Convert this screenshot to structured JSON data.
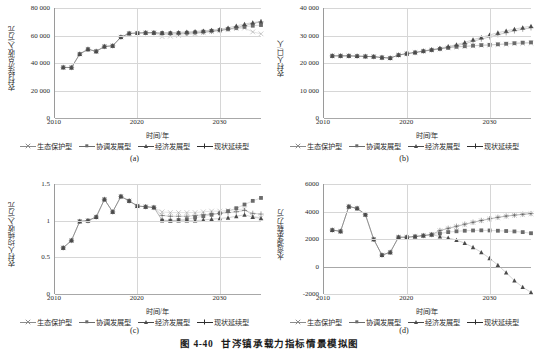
{
  "figure": {
    "number": "图 4-40",
    "title": "甘涔镇承载力指标情景模拟图"
  },
  "series_names": {
    "eco": "生态保护型",
    "coord": "协调发展型",
    "econ": "经济发展型",
    "status": "现状延续型"
  },
  "series_colors": {
    "eco": "#8c8c8c",
    "coord": "#6b6b6b",
    "econ": "#4a4a4a",
    "status": "#2e2e2e"
  },
  "common": {
    "xlabel": "时间/年",
    "xticks": [
      "2010",
      "2020",
      "2030"
    ],
    "xlim": [
      2010,
      2035
    ]
  },
  "chart_data": [
    {
      "id": "a",
      "panel_label": "(a)",
      "type": "line",
      "title": "",
      "xlabel": "时间/年",
      "ylabel": "农村经济总收入/万元",
      "xlim": [
        2010,
        2035
      ],
      "ylim": [
        0,
        80000
      ],
      "yticks": [
        0,
        20000,
        40000,
        60000,
        80000
      ],
      "ytick_labels": [
        "0",
        "20 000",
        "40 000",
        "60 000",
        "80 000"
      ],
      "xticks": [
        2010,
        2020,
        2030
      ],
      "grid": true,
      "legend_position": "bottom",
      "x": [
        2011,
        2012,
        2013,
        2014,
        2015,
        2016,
        2017,
        2018,
        2019,
        2020,
        2021,
        2022,
        2023,
        2024,
        2025,
        2026,
        2027,
        2028,
        2029,
        2030,
        2031,
        2032,
        2033,
        2034,
        2035
      ],
      "series": [
        {
          "name": "生态保护型",
          "key": "eco",
          "marker": "cross",
          "values": [
            36800,
            36700,
            46500,
            50000,
            48500,
            52000,
            52500,
            58800,
            61500,
            61800,
            62000,
            62000,
            59200,
            59500,
            60000,
            60600,
            61300,
            62000,
            62800,
            63500,
            64200,
            65000,
            65400,
            62600,
            61200
          ]
        },
        {
          "name": "协调发展型",
          "key": "coord",
          "marker": "square",
          "values": [
            36800,
            36700,
            46500,
            50000,
            48500,
            52000,
            52500,
            58800,
            61500,
            61800,
            62000,
            62000,
            61800,
            61700,
            61800,
            62000,
            62300,
            62800,
            63400,
            64000,
            64700,
            65500,
            66300,
            67100,
            67600
          ]
        },
        {
          "name": "经济发展型",
          "key": "econ",
          "marker": "triangle",
          "values": [
            36800,
            36700,
            46500,
            50000,
            48500,
            52000,
            52500,
            58800,
            61500,
            61800,
            62000,
            62000,
            62000,
            62100,
            62300,
            62600,
            63000,
            63400,
            63900,
            64500,
            65600,
            67000,
            68300,
            69400,
            70200
          ]
        },
        {
          "name": "现状延续型",
          "key": "status",
          "marker": "plus",
          "values": [
            36800,
            36700,
            46500,
            50000,
            48500,
            52000,
            52500,
            58800,
            61500,
            61800,
            62000,
            62000,
            61000,
            61000,
            61200,
            61500,
            61900,
            62400,
            63000,
            63700,
            64600,
            65800,
            67200,
            68700,
            69900
          ]
        }
      ]
    },
    {
      "id": "b",
      "panel_label": "(b)",
      "type": "line",
      "title": "",
      "xlabel": "时间/年",
      "ylabel": "农村人口/人",
      "xlim": [
        2010,
        2035
      ],
      "ylim": [
        0,
        40000
      ],
      "yticks": [
        0,
        10000,
        20000,
        30000,
        40000
      ],
      "ytick_labels": [
        "0",
        "10 000",
        "20 000",
        "30 000",
        "40 000"
      ],
      "xticks": [
        2010,
        2020,
        2030
      ],
      "grid": true,
      "legend_position": "bottom",
      "x": [
        2011,
        2012,
        2013,
        2014,
        2015,
        2016,
        2017,
        2018,
        2019,
        2020,
        2021,
        2022,
        2023,
        2024,
        2025,
        2026,
        2027,
        2028,
        2029,
        2030,
        2031,
        2032,
        2033,
        2034,
        2035
      ],
      "series": [
        {
          "name": "生态保护型",
          "key": "eco",
          "marker": "cross",
          "values": [
            22600,
            22600,
            22600,
            22500,
            22400,
            22300,
            22000,
            21800,
            22900,
            23400,
            23800,
            24300,
            24700,
            25100,
            25500,
            25800,
            26000,
            26200,
            26400,
            26500,
            26700,
            26800,
            27000,
            27100,
            27200
          ]
        },
        {
          "name": "协调发展型",
          "key": "coord",
          "marker": "square",
          "values": [
            22600,
            22600,
            22600,
            22500,
            22400,
            22300,
            22000,
            21800,
            22900,
            23400,
            23800,
            24300,
            24700,
            25100,
            25500,
            25900,
            26100,
            26300,
            26500,
            26600,
            26800,
            27000,
            27200,
            27400,
            27500
          ]
        },
        {
          "name": "经济发展型",
          "key": "econ",
          "marker": "triangle",
          "values": [
            22600,
            22600,
            22600,
            22500,
            22400,
            22300,
            22000,
            21800,
            22900,
            23400,
            23900,
            24400,
            24900,
            25400,
            26000,
            26700,
            27500,
            28500,
            29300,
            30200,
            31000,
            31700,
            32300,
            32900,
            33400
          ]
        },
        {
          "name": "现状延续型",
          "key": "status",
          "marker": "plus",
          "values": [
            22600,
            22600,
            22600,
            22500,
            22400,
            22300,
            22000,
            21800,
            22900,
            23400,
            23800,
            24300,
            24800,
            25200,
            25700,
            26300,
            27000,
            27900,
            28700,
            29500,
            30300,
            31000,
            31700,
            32300,
            32800
          ]
        }
      ]
    },
    {
      "id": "c",
      "panel_label": "(c)",
      "type": "line",
      "title": "",
      "xlabel": "时间/年",
      "ylabel": "农村人均纯收入/万元",
      "xlim": [
        2010,
        2035
      ],
      "ylim": [
        0,
        1.5
      ],
      "yticks": [
        0,
        0.5,
        1,
        1.5
      ],
      "ytick_labels": [
        "0",
        "0.5",
        "1",
        "1.5"
      ],
      "xticks": [
        2010,
        2020,
        2030
      ],
      "grid": true,
      "legend_position": "bottom",
      "x": [
        2011,
        2012,
        2013,
        2014,
        2015,
        2016,
        2017,
        2018,
        2019,
        2020,
        2021,
        2022,
        2023,
        2024,
        2025,
        2026,
        2027,
        2028,
        2029,
        2030,
        2031,
        2032,
        2033,
        2034,
        2035
      ],
      "series": [
        {
          "name": "生态保护型",
          "key": "eco",
          "marker": "cross",
          "values": [
            0.63,
            0.73,
            0.99,
            1.0,
            1.05,
            1.29,
            1.12,
            1.33,
            1.27,
            1.2,
            1.19,
            1.18,
            1.12,
            1.11,
            1.11,
            1.11,
            1.11,
            1.12,
            1.13,
            1.13,
            1.14,
            1.15,
            1.16,
            1.06,
            1.04
          ]
        },
        {
          "name": "协调发展型",
          "key": "coord",
          "marker": "square",
          "values": [
            0.63,
            0.73,
            0.99,
            1.0,
            1.05,
            1.29,
            1.12,
            1.33,
            1.27,
            1.2,
            1.19,
            1.18,
            1.0,
            1.0,
            1.01,
            1.02,
            1.04,
            1.06,
            1.08,
            1.1,
            1.13,
            1.17,
            1.22,
            1.27,
            1.31
          ]
        },
        {
          "name": "经济发展型",
          "key": "econ",
          "marker": "triangle",
          "values": [
            0.63,
            0.73,
            0.99,
            1.0,
            1.05,
            1.29,
            1.12,
            1.33,
            1.27,
            1.2,
            1.19,
            1.18,
            1.01,
            1.0,
            1.0,
            1.0,
            1.0,
            1.01,
            1.02,
            1.03,
            1.04,
            1.06,
            1.08,
            1.05,
            1.03
          ]
        },
        {
          "name": "现状延续型",
          "key": "status",
          "marker": "plus",
          "values": [
            0.63,
            0.73,
            0.99,
            1.0,
            1.05,
            1.29,
            1.12,
            1.33,
            1.27,
            1.2,
            1.19,
            1.18,
            1.07,
            1.06,
            1.06,
            1.06,
            1.07,
            1.08,
            1.09,
            1.1,
            1.11,
            1.12,
            1.14,
            1.1,
            1.09
          ]
        }
      ]
    },
    {
      "id": "d",
      "panel_label": "(d)",
      "type": "line",
      "title": "",
      "xlabel": "时间/年",
      "ylabel": "水资源承载力/万",
      "xlim": [
        2010,
        2035
      ],
      "ylim": [
        -2000,
        6000
      ],
      "yticks": [
        -2000,
        0,
        2000,
        4000,
        6000
      ],
      "ytick_labels": [
        "-2000",
        "0",
        "2000",
        "4000",
        "6000"
      ],
      "xticks": [
        2010,
        2020,
        2030
      ],
      "grid": true,
      "legend_position": "bottom",
      "x": [
        2011,
        2012,
        2013,
        2014,
        2015,
        2016,
        2017,
        2018,
        2019,
        2020,
        2021,
        2022,
        2023,
        2024,
        2025,
        2026,
        2027,
        2028,
        2029,
        2030,
        2031,
        2032,
        2033,
        2034,
        2035
      ],
      "series": [
        {
          "name": "生态保护型",
          "key": "eco",
          "marker": "cross",
          "values": [
            2650,
            2560,
            4360,
            4230,
            3780,
            1980,
            830,
            1030,
            2130,
            2130,
            2180,
            2250,
            2320,
            2600,
            2750,
            2900,
            3050,
            3200,
            3330,
            3450,
            3560,
            3650,
            3720,
            3780,
            3830
          ]
        },
        {
          "name": "协调发展型",
          "key": "coord",
          "marker": "square",
          "values": [
            2650,
            2560,
            4360,
            4230,
            3780,
            1980,
            830,
            1030,
            2130,
            2130,
            2180,
            2250,
            2320,
            2400,
            2500,
            2560,
            2600,
            2620,
            2630,
            2620,
            2600,
            2580,
            2550,
            2500,
            2420
          ]
        },
        {
          "name": "经济发展型",
          "key": "econ",
          "marker": "triangle",
          "values": [
            2650,
            2560,
            4360,
            4230,
            3780,
            1980,
            830,
            1030,
            2130,
            2130,
            2180,
            2250,
            2320,
            2180,
            2080,
            1920,
            1700,
            1400,
            1030,
            600,
            100,
            -450,
            -1030,
            -1500,
            -1880
          ]
        },
        {
          "name": "现状延续型",
          "key": "status",
          "marker": "plus",
          "values": [
            2650,
            2560,
            4360,
            4230,
            3780,
            1980,
            830,
            1030,
            2130,
            2130,
            2180,
            2250,
            2320,
            2620,
            2780,
            2930,
            3080,
            3220,
            3350,
            3470,
            3580,
            3670,
            3740,
            3800,
            3850
          ]
        }
      ]
    }
  ]
}
